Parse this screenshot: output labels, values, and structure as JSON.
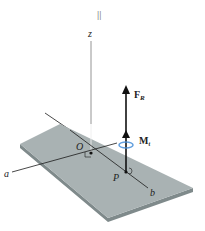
{
  "diagram": {
    "top_mark": "||",
    "labels": {
      "z_axis": "z",
      "origin": "O",
      "point_p": "P",
      "axis_a": "a",
      "axis_b": "b",
      "force": "F",
      "force_sub": "R",
      "moment": "M",
      "moment_sub": "t"
    },
    "colors": {
      "plate_top": "#a9b2b3",
      "plate_edge": "#7f8a8b",
      "lines": "#1a1a1a",
      "moment_swirl": "#4a90d9"
    }
  }
}
